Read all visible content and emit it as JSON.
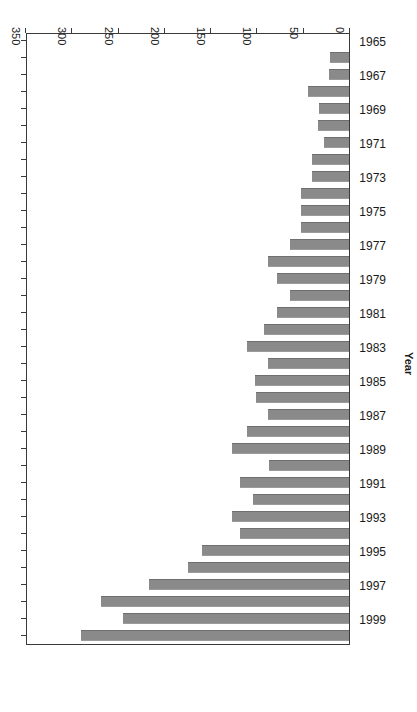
{
  "chart_data": {
    "type": "bar",
    "orientation": "horizontal",
    "title": "",
    "xlabel": "Publications",
    "ylabel": "Year",
    "xlim": [
      0,
      350
    ],
    "xticks": [
      0,
      50,
      100,
      150,
      200,
      250,
      300,
      350
    ],
    "xtick_labels": [
      "0",
      "50",
      "100",
      "150",
      "200",
      "250",
      "300",
      "350"
    ],
    "x_axis_direction": "right-to-left",
    "grid": false,
    "legend": null,
    "bar_color": "#8a8a8a",
    "rotation_note": "figure rendered rotated 180 degrees",
    "categories": [
      "1965",
      "1966",
      "1967",
      "1968",
      "1969",
      "1970",
      "1971",
      "1972",
      "1973",
      "1974",
      "1975",
      "1976",
      "1977",
      "1978",
      "1979",
      "1980",
      "1981",
      "1982",
      "1983",
      "1984",
      "1985",
      "1986",
      "1987",
      "1988",
      "1989",
      "1990",
      "1991",
      "1992",
      "1993",
      "1994",
      "1995",
      "1996",
      "1997",
      "1998",
      "1999",
      "2000"
    ],
    "ytick_labels": [
      "1965",
      "1967",
      "1969",
      "1971",
      "1973",
      "1975",
      "1977",
      "1979",
      "1981",
      "1983",
      "1985",
      "1987",
      "1989",
      "1991",
      "1993",
      "1995",
      "1997",
      "1999"
    ],
    "values": [
      0,
      20,
      22,
      44,
      32,
      34,
      27,
      40,
      40,
      52,
      52,
      52,
      64,
      88,
      78,
      64,
      78,
      92,
      110,
      87,
      102,
      100,
      88,
      110,
      126,
      86,
      118,
      104,
      126,
      118,
      159,
      174,
      216,
      268,
      244,
      290
    ],
    "series": [
      {
        "name": "Publications",
        "values": [
          0,
          20,
          22,
          44,
          32,
          34,
          27,
          40,
          40,
          52,
          52,
          52,
          64,
          88,
          78,
          64,
          78,
          92,
          110,
          87,
          102,
          100,
          88,
          110,
          126,
          86,
          118,
          104,
          126,
          118,
          159,
          174,
          216,
          268,
          244,
          290
        ]
      }
    ]
  }
}
